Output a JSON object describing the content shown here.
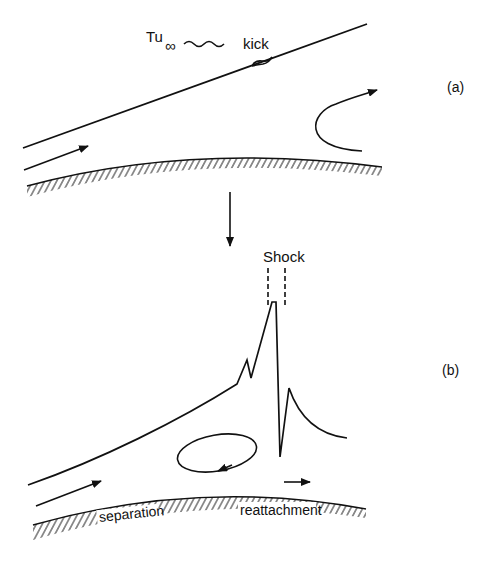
{
  "figure": {
    "panel_a": {
      "label": "(a)",
      "freestream_turbulence": {
        "symbol": "Tu",
        "subscript": "∞"
      },
      "kick_label": "kick"
    },
    "panel_b": {
      "label": "(b)",
      "shock_label": "Shock",
      "separation_label": "separation",
      "reattachment_label": "reattachment"
    },
    "colors": {
      "ink": "#111111",
      "background": "#ffffff"
    }
  }
}
